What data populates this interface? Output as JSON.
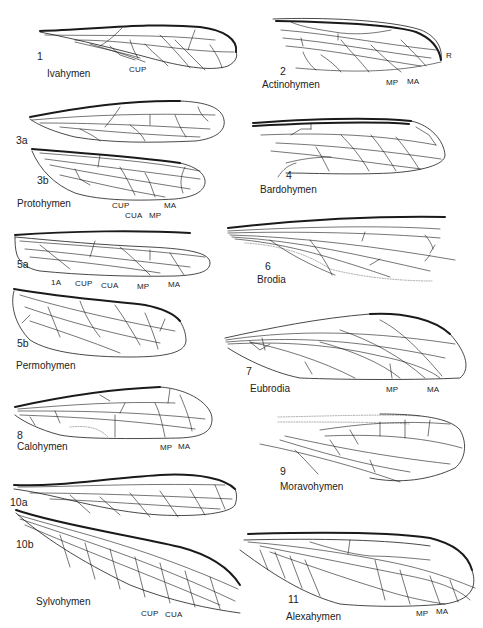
{
  "figure": {
    "panels": [
      {
        "id": "1",
        "number": "1",
        "genus": "Ivahymen",
        "vein_labels": [
          "CUP"
        ]
      },
      {
        "id": "2",
        "number": "2",
        "genus": "Actinohymen",
        "vein_labels": [
          "MP",
          "MA",
          "R"
        ]
      },
      {
        "id": "3a",
        "number": "3a",
        "genus": "",
        "vein_labels": []
      },
      {
        "id": "3b",
        "number": "3b",
        "genus": "Protohymen",
        "vein_labels": [
          "CUP",
          "CUA",
          "MP",
          "MA"
        ]
      },
      {
        "id": "4",
        "number": "4",
        "genus": "Bardohymen",
        "vein_labels": []
      },
      {
        "id": "5a",
        "number": "5a",
        "genus": "",
        "vein_labels": [
          "1A",
          "CUP",
          "CUA",
          "MP",
          "MA"
        ]
      },
      {
        "id": "5b",
        "number": "5b",
        "genus": "Permohymen",
        "vein_labels": []
      },
      {
        "id": "6",
        "number": "6",
        "genus": "Brodia",
        "vein_labels": []
      },
      {
        "id": "7",
        "number": "7",
        "genus": "Eubrodia",
        "vein_labels": [
          "MP",
          "MA"
        ]
      },
      {
        "id": "8",
        "number": "8",
        "genus": "Calohymen",
        "vein_labels": [
          "MP",
          "MA"
        ]
      },
      {
        "id": "9",
        "number": "9",
        "genus": "Moravohymen",
        "vein_labels": []
      },
      {
        "id": "10a",
        "number": "10a",
        "genus": "",
        "vein_labels": []
      },
      {
        "id": "10b",
        "number": "10b",
        "genus": "Sylvohymen",
        "vein_labels": [
          "CUP",
          "CUA"
        ]
      },
      {
        "id": "11",
        "number": "11",
        "genus": "Alexahymen",
        "vein_labels": [
          "MP",
          "MA"
        ]
      }
    ]
  },
  "colors": {
    "ink": "#1a1a1a",
    "background": "#ffffff"
  }
}
